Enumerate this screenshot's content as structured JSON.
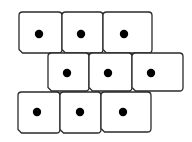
{
  "diagram": {
    "type": "cell-tissue",
    "colors": {
      "background": "#ffffff",
      "cell_outline": "#2a2a2a",
      "cell_fill": "#ffffff",
      "nucleus": "#000000"
    },
    "rows": [
      {
        "name": "top-row",
        "cells": [
          {
            "x": 19,
            "y": 12,
            "w": 43,
            "h": 41,
            "nucleus": {
              "cx": 39,
              "cy": 34,
              "r": 4.2
            }
          },
          {
            "x": 62,
            "y": 12,
            "w": 41,
            "h": 41,
            "nucleus": {
              "cx": 81,
              "cy": 34,
              "r": 4.2
            }
          },
          {
            "x": 103,
            "y": 12,
            "w": 49,
            "h": 41,
            "nucleus": {
              "cx": 124,
              "cy": 34,
              "r": 4.2
            }
          }
        ]
      },
      {
        "name": "middle-row",
        "cells": [
          {
            "x": 48,
            "y": 53,
            "w": 41,
            "h": 38,
            "nucleus": {
              "cx": 67,
              "cy": 73,
              "r": 4.2
            }
          },
          {
            "x": 89,
            "y": 53,
            "w": 43,
            "h": 38,
            "nucleus": {
              "cx": 108,
              "cy": 73,
              "r": 4.2
            }
          },
          {
            "x": 132,
            "y": 53,
            "w": 51,
            "h": 38,
            "nucleus": {
              "cx": 151,
              "cy": 73,
              "r": 4.2
            }
          }
        ]
      },
      {
        "name": "bottom-row",
        "cells": [
          {
            "x": 18,
            "y": 92,
            "w": 42,
            "h": 41,
            "nucleus": {
              "cx": 37,
              "cy": 112,
              "r": 4.2
            }
          },
          {
            "x": 60,
            "y": 92,
            "w": 41,
            "h": 41,
            "nucleus": {
              "cx": 80,
              "cy": 112,
              "r": 4.2
            }
          },
          {
            "x": 101,
            "y": 92,
            "w": 50,
            "h": 40,
            "nucleus": {
              "cx": 123,
              "cy": 112,
              "r": 4.2
            }
          }
        ]
      }
    ],
    "cell_count": 9,
    "nucleus_count": 9
  }
}
